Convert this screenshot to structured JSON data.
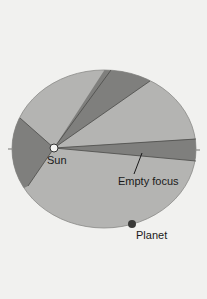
{
  "diagram": {
    "labels": {
      "sun": "Sun",
      "empty_focus": "Empty focus",
      "planet": "Planet"
    },
    "colors": {
      "background": "#f1f1ef",
      "ellipse_fill": "#b4b4b2",
      "wedge_fill": "#7f7f7d",
      "outline": "#555555",
      "sun_fill": "#f4f4f2",
      "planet_fill": "#3a3a38"
    },
    "ellipse": {
      "cx": 104,
      "cy": 149,
      "rx": 92,
      "ry": 79
    },
    "sun": {
      "cx": 54,
      "cy": 148,
      "r": 4
    },
    "planet": {
      "cx": 132,
      "cy": 224,
      "r": 4
    },
    "wedges": [
      {
        "name": "top-wedge",
        "p1": [
          111,
          70
        ],
        "p2": [
          150,
          81
        ]
      },
      {
        "name": "left-wedge",
        "p1": [
          20,
          118
        ],
        "p2": [
          28,
          186
        ]
      },
      {
        "name": "right-wedge",
        "p1": [
          196,
          139
        ],
        "p2": [
          196,
          161
        ]
      }
    ]
  }
}
